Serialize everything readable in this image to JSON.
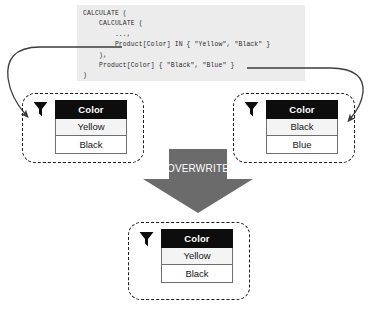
{
  "code_block": {
    "language": "dax",
    "lines": [
      "CALCULATE (",
      "    CALCULATE (",
      "        ...,",
      "        Product[Color] IN { \"Yellow\", \"Black\" }",
      "    ),",
      "    Product[Color] { \"Black\", \"Blue\" }",
      ")"
    ]
  },
  "tables": {
    "left": {
      "name": "inner-filter-table",
      "header": "Color",
      "rows": [
        "Yellow",
        "Black"
      ]
    },
    "right": {
      "name": "outer-filter-table",
      "header": "Color",
      "rows": [
        "Black",
        "Blue"
      ]
    },
    "result": {
      "name": "result-filter-table",
      "header": "Color",
      "rows": [
        "Yellow",
        "Black"
      ]
    }
  },
  "overwrite": {
    "label": "OVERWRITE"
  },
  "icons": {
    "funnel": "filter-funnel-icon"
  },
  "colors": {
    "code_background": "#ececed",
    "code_text": "#2b2b2b",
    "table_header_background": "#0d0d0d",
    "table_header_text": "#ffffff",
    "table_row_alt_background": "#f4f4f4",
    "dashed_border": "#1a1a1a",
    "arrow_fill": "#6b6b6b",
    "connector_stroke": "#3d3d3d",
    "canvas_background": "#ffffff"
  }
}
